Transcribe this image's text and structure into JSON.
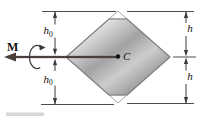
{
  "figure": {
    "moment_label": "M",
    "centroid_label": "C",
    "dimensions": {
      "left_top": {
        "symbol": "h",
        "subscript": "0"
      },
      "left_bottom": {
        "symbol": "h",
        "subscript": "0"
      },
      "right_top": {
        "symbol": "h",
        "subscript": ""
      },
      "right_bottom": {
        "symbol": "h",
        "subscript": ""
      }
    },
    "colors": {
      "background": "#ffffff",
      "section_fill_band_a": "#c8c8c8",
      "section_fill_band_b": "#dedede",
      "section_fill_band_c": "#a2a2a2",
      "section_fill_band_d": "#cdcdcd",
      "section_fill_band_e": "#8e8e8e",
      "section_outline": "#7d7d7d",
      "removed_corner_outline": "#9a9a9a",
      "moment_arrow": "#4a413c",
      "dimension_line": "#3a3a3a",
      "label_text": "#111111"
    }
  }
}
